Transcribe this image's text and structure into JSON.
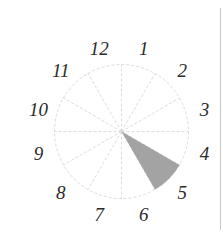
{
  "chart_data": {
    "type": "polar-sector",
    "title": "",
    "sectors": 12,
    "labels": [
      "12",
      "1",
      "2",
      "3",
      "4",
      "5",
      "6",
      "7",
      "8",
      "9",
      "10",
      "11"
    ],
    "label_positions": "sector midpoints, clockwise from top (12 o'clock line split between 12 and 1)",
    "highlighted_sectors": [
      {
        "label": "5",
        "start_clock": 4,
        "end_clock": 5,
        "value": 1.0,
        "color": "#a3a3a3"
      }
    ],
    "values": [
      0,
      0,
      0,
      0,
      0,
      1,
      0,
      0,
      0,
      0,
      0,
      0
    ],
    "rmax": 1.0,
    "grid": {
      "spokes": 12,
      "outer_circle": true,
      "style": "dashed",
      "color": "#dcdcdc"
    }
  },
  "layout": {
    "center_x": 121.5,
    "center_y": 131.5,
    "radius": 67,
    "label_radius": 86
  },
  "colors": {
    "wedge": "#a3a3a3",
    "grid": "#dcdcdc",
    "label": "#2b2b2b",
    "divider": "#c8c8c8"
  }
}
